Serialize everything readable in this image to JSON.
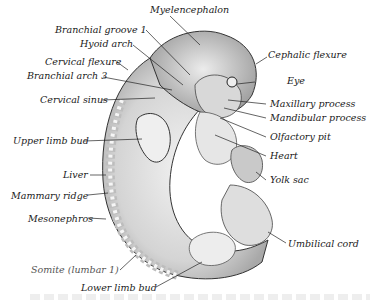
{
  "figure": {
    "labels": {
      "myelencephalon": "Myelencephalon",
      "branchial_groove_1": "Branchial groove 1",
      "hyoid_arch": "Hyoid arch",
      "cervical_flexure": "Cervical flexure",
      "branchial_arch_3": "Branchial arch 3",
      "cervical_sinus": "Cervical sinus",
      "cephalic_flexure": "Cephalic flexure",
      "eye": "Eye",
      "maxillary_process": "Maxillary process",
      "mandibular_process": "Mandibular process",
      "olfactory_pit": "Olfactory pit",
      "heart": "Heart",
      "upper_limb_bud": "Upper limb bud",
      "liver": "Liver",
      "yolk_sac": "Yolk sac",
      "mammary_ridge": "Mammary ridge",
      "mesonephros": "Mesonephros",
      "umbilical_cord": "Umbilical cord",
      "somite": "Somite (lumbar 1)",
      "lower_limb_bud": "Lower limb bud"
    }
  }
}
